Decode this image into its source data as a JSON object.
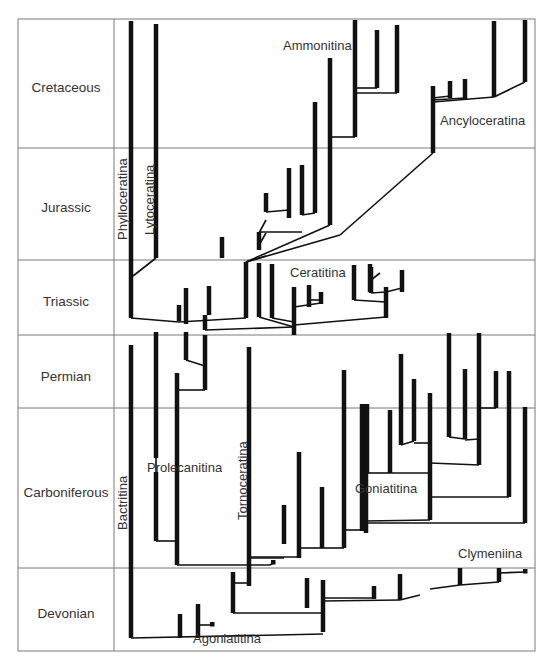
{
  "diagram": {
    "frame": {
      "x1": 18,
      "y1": 19,
      "x2": 535,
      "y2": 651,
      "label_col_x": 114
    },
    "periods": [
      {
        "name": "Cretaceous",
        "top": 19,
        "bottom": 148,
        "label_y": 87
      },
      {
        "name": "Jurassic",
        "top": 148,
        "bottom": 260,
        "label_y": 207
      },
      {
        "name": "Triassic",
        "top": 260,
        "bottom": 335,
        "label_y": 301
      },
      {
        "name": "Permian",
        "top": 335,
        "bottom": 408,
        "label_y": 376
      },
      {
        "name": "Carboniferous",
        "top": 408,
        "bottom": 568,
        "label_y": 492
      },
      {
        "name": "Devonian",
        "top": 568,
        "bottom": 651,
        "label_y": 613
      }
    ],
    "clades": [
      {
        "name": "Phylloceratina",
        "x": 127,
        "y": 240,
        "rotate": true
      },
      {
        "name": "Lytoceratina",
        "x": 154,
        "y": 235,
        "rotate": true
      },
      {
        "name": "Ammonitina",
        "x": 283,
        "y": 50,
        "rotate": false
      },
      {
        "name": "Ancyloceratina",
        "x": 440,
        "y": 125,
        "rotate": false
      },
      {
        "name": "Ceratitina",
        "x": 290,
        "y": 277,
        "rotate": false
      },
      {
        "name": "Bactritina",
        "x": 127,
        "y": 530,
        "rotate": true
      },
      {
        "name": "Prolecanitina",
        "x": 147,
        "y": 472,
        "rotate": false
      },
      {
        "name": "Tornoceratina",
        "x": 247,
        "y": 520,
        "rotate": true
      },
      {
        "name": "Goniatitina",
        "x": 355,
        "y": 493,
        "rotate": false
      },
      {
        "name": "Clymeniina",
        "x": 458,
        "y": 558,
        "rotate": false
      },
      {
        "name": "Agoniatitina",
        "x": 193,
        "y": 643,
        "rotate": false
      }
    ],
    "branches": [
      [
        131,
        21,
        131,
        318
      ],
      [
        156,
        24,
        156,
        258
      ],
      [
        179,
        305,
        179,
        321
      ],
      [
        186,
        288,
        186,
        324
      ],
      [
        209,
        286,
        209,
        315
      ],
      [
        205,
        315,
        205,
        330
      ],
      [
        246,
        262,
        246,
        318
      ],
      [
        222,
        237,
        222,
        258
      ],
      [
        259,
        232,
        259,
        250
      ],
      [
        266,
        193,
        266,
        212
      ],
      [
        289,
        168,
        289,
        218
      ],
      [
        302,
        165,
        302,
        215
      ],
      [
        315,
        102,
        315,
        213
      ],
      [
        330,
        58,
        330,
        225
      ],
      [
        355,
        20,
        355,
        137
      ],
      [
        377,
        30,
        377,
        88
      ],
      [
        397,
        25,
        397,
        93
      ],
      [
        433,
        86,
        433,
        153
      ],
      [
        450,
        81,
        450,
        98
      ],
      [
        465,
        79,
        465,
        100
      ],
      [
        494,
        21,
        494,
        97
      ],
      [
        525,
        20,
        525,
        82
      ],
      [
        259,
        263,
        259,
        317
      ],
      [
        272,
        264,
        272,
        318
      ],
      [
        294,
        287,
        294,
        335
      ],
      [
        309,
        285,
        309,
        307
      ],
      [
        321,
        292,
        321,
        304
      ],
      [
        354,
        265,
        354,
        300
      ],
      [
        371,
        267,
        371,
        293
      ],
      [
        370,
        264,
        370,
        292
      ],
      [
        386,
        287,
        386,
        318
      ],
      [
        402,
        270,
        402,
        292
      ],
      [
        131,
        345,
        131,
        638
      ],
      [
        156,
        332,
        156,
        458
      ],
      [
        156,
        472,
        156,
        541
      ],
      [
        177,
        373,
        177,
        565
      ],
      [
        186,
        332,
        186,
        360
      ],
      [
        205,
        335,
        205,
        390
      ],
      [
        249,
        347,
        249,
        586
      ],
      [
        233,
        572,
        233,
        613
      ],
      [
        284,
        505,
        284,
        544
      ],
      [
        299,
        452,
        299,
        558
      ],
      [
        322,
        487,
        322,
        548
      ],
      [
        344,
        370,
        344,
        548
      ],
      [
        362,
        404,
        362,
        531
      ],
      [
        366,
        404,
        366,
        533
      ],
      [
        367,
        404,
        367,
        473
      ],
      [
        390,
        410,
        390,
        473
      ],
      [
        401,
        354,
        401,
        445
      ],
      [
        414,
        379,
        414,
        441
      ],
      [
        430,
        393,
        430,
        520
      ],
      [
        449,
        333,
        449,
        437
      ],
      [
        465,
        369,
        465,
        439
      ],
      [
        479,
        333,
        479,
        465
      ],
      [
        496,
        371,
        496,
        408
      ],
      [
        509,
        371,
        509,
        497
      ],
      [
        525,
        407,
        525,
        523
      ],
      [
        307,
        578,
        307,
        608
      ],
      [
        323,
        580,
        323,
        632
      ],
      [
        374,
        586,
        374,
        599
      ],
      [
        400,
        574,
        400,
        600
      ],
      [
        460,
        568,
        460,
        585
      ],
      [
        499,
        568,
        499,
        582
      ],
      [
        180,
        614,
        180,
        638
      ],
      [
        198,
        604,
        198,
        638
      ]
    ],
    "links": [
      [
        131,
        318,
        179,
        322
      ],
      [
        179,
        322,
        246,
        318
      ],
      [
        133,
        276,
        156,
        258
      ],
      [
        246,
        262,
        266,
        256
      ],
      [
        259,
        245,
        266,
        233
      ],
      [
        259,
        233,
        266,
        220
      ],
      [
        246,
        262,
        330,
        225
      ],
      [
        246,
        262,
        340,
        235
      ],
      [
        340,
        235,
        433,
        153
      ],
      [
        259,
        232,
        302,
        232
      ],
      [
        266,
        212,
        289,
        210
      ],
      [
        302,
        215,
        315,
        213
      ],
      [
        330,
        137,
        355,
        137
      ],
      [
        355,
        88,
        377,
        88
      ],
      [
        355,
        93,
        397,
        93
      ],
      [
        433,
        98,
        450,
        96
      ],
      [
        433,
        100,
        465,
        98
      ],
      [
        433,
        102,
        494,
        97
      ],
      [
        494,
        97,
        525,
        82
      ],
      [
        259,
        317,
        294,
        327
      ],
      [
        272,
        318,
        294,
        322
      ],
      [
        294,
        325,
        386,
        317
      ],
      [
        294,
        307,
        321,
        303
      ],
      [
        309,
        300,
        321,
        300
      ],
      [
        354,
        300,
        386,
        302
      ],
      [
        371,
        293,
        386,
        292
      ],
      [
        371,
        280,
        380,
        273
      ],
      [
        386,
        292,
        402,
        288
      ],
      [
        156,
        458,
        156,
        472
      ],
      [
        177,
        541,
        156,
        541
      ],
      [
        177,
        565,
        270,
        565
      ],
      [
        270,
        565,
        275,
        562
      ],
      [
        186,
        360,
        205,
        366
      ],
      [
        205,
        330,
        294,
        327
      ],
      [
        205,
        390,
        177,
        390
      ],
      [
        233,
        583,
        249,
        583
      ],
      [
        233,
        613,
        323,
        613
      ],
      [
        131,
        638,
        323,
        634
      ],
      [
        198,
        625,
        211,
        625
      ],
      [
        249,
        558,
        284,
        558
      ],
      [
        284,
        544,
        284,
        544
      ],
      [
        299,
        548,
        322,
        548
      ],
      [
        322,
        548,
        344,
        548
      ],
      [
        249,
        557,
        299,
        557
      ],
      [
        344,
        530,
        362,
        530
      ],
      [
        366,
        521,
        430,
        520
      ],
      [
        366,
        523,
        525,
        523
      ],
      [
        367,
        473,
        390,
        473
      ],
      [
        390,
        473,
        430,
        473
      ],
      [
        401,
        445,
        414,
        441
      ],
      [
        414,
        443,
        430,
        443
      ],
      [
        430,
        463,
        479,
        465
      ],
      [
        430,
        497,
        509,
        497
      ],
      [
        449,
        437,
        465,
        439
      ],
      [
        465,
        440,
        479,
        439
      ],
      [
        479,
        408,
        496,
        408
      ],
      [
        323,
        598,
        374,
        598
      ],
      [
        323,
        601,
        400,
        600
      ],
      [
        400,
        600,
        420,
        595
      ],
      [
        430,
        589,
        460,
        585
      ],
      [
        460,
        585,
        499,
        582
      ],
      [
        499,
        573,
        525,
        572
      ]
    ],
    "dots": [
      [
        273,
        562
      ],
      [
        212,
        624
      ],
      [
        525,
        571
      ]
    ]
  }
}
